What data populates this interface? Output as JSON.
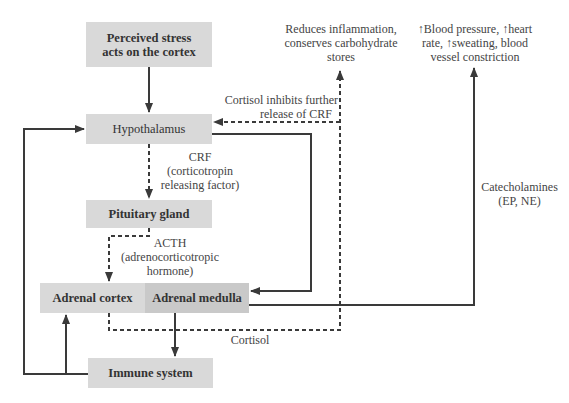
{
  "diagram": {
    "nodes": {
      "perceived_stress": "Perceived stress acts on the cortex",
      "perceived_stress_line1": "Perceived stress",
      "perceived_stress_line2": "acts on the cortex",
      "hypothalamus": "Hypothalamus",
      "pituitary": "Pituitary gland",
      "adrenal_cortex": "Adrenal cortex",
      "adrenal_medulla": "Adrenal medulla",
      "immune_system": "Immune system"
    },
    "labels": {
      "crf_line1": "CRF",
      "crf_line2": "(corticotropin",
      "crf_line3": "releasing factor)",
      "acth_line1": "ACTH",
      "acth_line2": "(adrenocorticotropic",
      "acth_line3": "hormone)",
      "cortisol": "Cortisol",
      "cortisol_inhibits_line1": "Cortisol inhibits further",
      "cortisol_inhibits_line2": "release of CRF",
      "reduces_line1": "Reduces inflammation,",
      "reduces_line2": "conserves carbohydrate",
      "reduces_line3": "stores",
      "effects_line1": "↑Blood pressure, ↑heart",
      "effects_line2": "rate, ↑sweating, blood",
      "effects_line3": "vessel constriction",
      "catecholamines_line1": "Catecholamines",
      "catecholamines_line2": "(EP, NE)"
    },
    "edges": [
      {
        "from": "Perceived stress",
        "to": "Hypothalamus",
        "style": "solid"
      },
      {
        "from": "Hypothalamus",
        "to": "Pituitary gland",
        "style": "dashed",
        "label": "CRF"
      },
      {
        "from": "Pituitary gland",
        "to": "Adrenal cortex",
        "style": "dashed",
        "label": "ACTH"
      },
      {
        "from": "Hypothalamus",
        "to": "Adrenal medulla",
        "style": "solid"
      },
      {
        "from": "Adrenal cortex",
        "to": "Reduces inflammation",
        "style": "dashed",
        "label": "Cortisol"
      },
      {
        "from": "Adrenal cortex",
        "to": "Hypothalamus",
        "style": "dashed",
        "label": "Cortisol inhibits further release of CRF"
      },
      {
        "from": "Adrenal medulla",
        "to": "Blood pressure effects",
        "style": "solid",
        "label": "Catecholamines (EP, NE)"
      },
      {
        "from": "Adrenal medulla",
        "to": "Immune system",
        "style": "solid"
      },
      {
        "from": "Immune system",
        "to": "Adrenal cortex",
        "style": "solid"
      },
      {
        "from": "Immune system",
        "to": "Hypothalamus",
        "style": "solid"
      }
    ],
    "colors": {
      "box": "#d9d9d9",
      "box_dark": "#c9c9c9",
      "line": "#3a3a3a"
    }
  }
}
